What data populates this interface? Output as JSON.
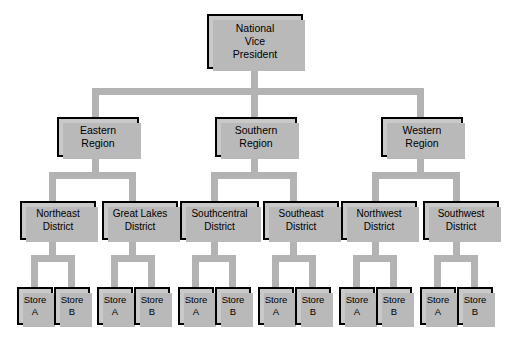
{
  "diagram": {
    "type": "org-chart",
    "background_color": "#ffffff",
    "box_fill_color": "#c9c9c9",
    "box_border_color": "#000000",
    "connector_color": "#b3b3b3",
    "shadow_color": "#b9b9b9"
  },
  "root": {
    "id": "national-vice-president",
    "label": "National\nVice\nPresident",
    "level": "executive"
  },
  "regions": [
    {
      "id": "eastern-region",
      "label": "Eastern\nRegion"
    },
    {
      "id": "southern-region",
      "label": "Southern\nRegion"
    },
    {
      "id": "western-region",
      "label": "Western\nRegion"
    }
  ],
  "districts": [
    {
      "id": "northeast-district",
      "label": "Northeast\nDistrict",
      "parent": "eastern-region"
    },
    {
      "id": "great-lakes-district",
      "label": "Great Lakes\nDistrict",
      "parent": "eastern-region"
    },
    {
      "id": "southcentral-district",
      "label": "Southcentral\nDistrict",
      "parent": "southern-region"
    },
    {
      "id": "southeast-district",
      "label": "Southeast\nDistrict",
      "parent": "southern-region"
    },
    {
      "id": "northwest-district",
      "label": "Northwest\nDistrict",
      "parent": "western-region"
    },
    {
      "id": "southwest-district",
      "label": "Southwest\nDistrict",
      "parent": "western-region"
    }
  ],
  "stores": [
    {
      "id": "store-ne-a",
      "label": "Store\nA",
      "parent": "northeast-district"
    },
    {
      "id": "store-ne-b",
      "label": "Store\nB",
      "parent": "northeast-district"
    },
    {
      "id": "store-gl-a",
      "label": "Store\nA",
      "parent": "great-lakes-district"
    },
    {
      "id": "store-gl-b",
      "label": "Store\nB",
      "parent": "great-lakes-district"
    },
    {
      "id": "store-sc-a",
      "label": "Store\nA",
      "parent": "southcentral-district"
    },
    {
      "id": "store-sc-b",
      "label": "Store\nB",
      "parent": "southcentral-district"
    },
    {
      "id": "store-se-a",
      "label": "Store\nA",
      "parent": "southeast-district"
    },
    {
      "id": "store-se-b",
      "label": "Store\nB",
      "parent": "southeast-district"
    },
    {
      "id": "store-nw-a",
      "label": "Store\nA",
      "parent": "northwest-district"
    },
    {
      "id": "store-nw-b",
      "label": "Store\nB",
      "parent": "northwest-district"
    },
    {
      "id": "store-sw-a",
      "label": "Store\nA",
      "parent": "southwest-district"
    },
    {
      "id": "store-sw-b",
      "label": "Store\nB",
      "parent": "southwest-district"
    }
  ]
}
